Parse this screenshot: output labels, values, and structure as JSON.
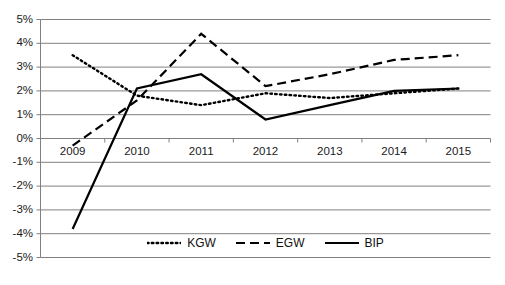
{
  "chart_data": {
    "type": "line",
    "title": "",
    "subtitle": "",
    "xlabel": "",
    "ylabel": "",
    "categories": [
      "2009",
      "2010",
      "2011",
      "2012",
      "2013",
      "2014",
      "2015"
    ],
    "x": [
      2009,
      2010,
      2011,
      2012,
      2013,
      2014,
      2015
    ],
    "ylim": [
      -5,
      5
    ],
    "y_tick_labels": [
      "5%",
      "4%",
      "3%",
      "2%",
      "1%",
      "0%",
      "-1%",
      "-2%",
      "-3%",
      "-4%",
      "-5%"
    ],
    "y_tick_values": [
      5,
      4,
      3,
      2,
      1,
      0,
      -1,
      -2,
      -3,
      -4,
      -5
    ],
    "y_unit": "%",
    "grid": "horizontal",
    "legend_position": "bottom-inside",
    "series": [
      {
        "name": "KGW",
        "style": "dotted",
        "color": "#000000",
        "values": [
          3.5,
          1.8,
          1.4,
          1.9,
          1.7,
          1.9,
          2.1
        ]
      },
      {
        "name": "EGW",
        "style": "dashed",
        "color": "#000000",
        "values": [
          -0.3,
          1.6,
          4.4,
          2.2,
          2.7,
          3.3,
          3.5
        ]
      },
      {
        "name": "BIP",
        "style": "solid",
        "color": "#000000",
        "values": [
          -3.8,
          2.1,
          2.7,
          0.8,
          1.4,
          2.0,
          2.1
        ]
      }
    ]
  },
  "legend": {
    "items": [
      {
        "label": "KGW",
        "style": "dotted"
      },
      {
        "label": "EGW",
        "style": "dashed"
      },
      {
        "label": "BIP",
        "style": "solid"
      }
    ]
  },
  "colors": {
    "series": "#000000",
    "gridline": "#808080",
    "axis": "#808080",
    "background": "#ffffff",
    "text": "#1a1a1a"
  }
}
